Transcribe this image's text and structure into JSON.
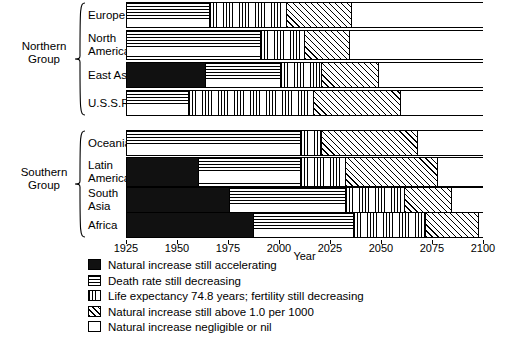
{
  "chart_data": {
    "type": "bar",
    "orientation": "horizontal-stacked-timeline",
    "title": "",
    "xlabel": "Year",
    "ylabel": "",
    "xlim": [
      1925,
      2100
    ],
    "xticks": [
      1925,
      1950,
      1975,
      2000,
      2025,
      2050,
      2075,
      2100
    ],
    "xticklabels": [
      "1925",
      "1950",
      "1975",
      "2000",
      "2025",
      "2050",
      "2075",
      "2100"
    ],
    "grid": false,
    "legend_position": "below",
    "stage_names": [
      "Natural increase still accelerating",
      "Death rate still decreasing",
      "Life expectancy 74.8 years; fertility still decreasing",
      "Natural increase still above 1.0 per 1000",
      "Natural increase negligible or nil"
    ],
    "stage_patterns": [
      "solid-black",
      "horizontal-lines",
      "vertical-lines",
      "diagonal-hatch",
      "white-empty"
    ],
    "groups": [
      {
        "name": "Northern Group",
        "regions": [
          {
            "name": "Europe",
            "label_lines": [
              "Europe"
            ],
            "boundaries": [
              1925,
              1965,
              2003,
              2035,
              2100
            ],
            "segments": [
              {
                "stage": 0,
                "start": 1925,
                "end": 1925
              },
              {
                "stage": 1,
                "start": 1925,
                "end": 1965
              },
              {
                "stage": 2,
                "start": 1965,
                "end": 2003
              },
              {
                "stage": 3,
                "start": 2003,
                "end": 2035
              },
              {
                "stage": 4,
                "start": 2035,
                "end": 2100
              }
            ]
          },
          {
            "name": "North America",
            "label_lines": [
              "North",
              "America"
            ],
            "boundaries": [
              1925,
              1990,
              2012,
              2034,
              2100
            ],
            "segments": [
              {
                "stage": 0,
                "start": 1925,
                "end": 1925
              },
              {
                "stage": 1,
                "start": 1925,
                "end": 1990
              },
              {
                "stage": 2,
                "start": 1990,
                "end": 2012
              },
              {
                "stage": 3,
                "start": 2012,
                "end": 2034
              },
              {
                "stage": 4,
                "start": 2034,
                "end": 2100
              }
            ]
          },
          {
            "name": "East Asia",
            "label_lines": [
              "East Asia"
            ],
            "boundaries": [
              1963,
              2000,
              2020,
              2048
            ],
            "segments": [
              {
                "stage": 0,
                "start": 1925,
                "end": 1963
              },
              {
                "stage": 1,
                "start": 1963,
                "end": 2000
              },
              {
                "stage": 2,
                "start": 2000,
                "end": 2020
              },
              {
                "stage": 3,
                "start": 2020,
                "end": 2048
              },
              {
                "stage": 4,
                "start": 2048,
                "end": 2100
              }
            ]
          },
          {
            "name": "U.S.S.R.",
            "label_lines": [
              "U.S.S.R."
            ],
            "boundaries": [
              1925,
              1955,
              2016,
              2059,
              2100
            ],
            "segments": [
              {
                "stage": 0,
                "start": 1925,
                "end": 1925
              },
              {
                "stage": 1,
                "start": 1925,
                "end": 1955
              },
              {
                "stage": 2,
                "start": 1955,
                "end": 2016
              },
              {
                "stage": 3,
                "start": 2016,
                "end": 2059
              },
              {
                "stage": 4,
                "start": 2059,
                "end": 2100
              }
            ]
          }
        ]
      },
      {
        "name": "Southern Group",
        "regions": [
          {
            "name": "Oceania",
            "label_lines": [
              "Oceania"
            ],
            "boundaries": [
              1925,
              2010,
              2020,
              2067,
              2100
            ],
            "segments": [
              {
                "stage": 0,
                "start": 1925,
                "end": 1925
              },
              {
                "stage": 1,
                "start": 1925,
                "end": 2010
              },
              {
                "stage": 2,
                "start": 2010,
                "end": 2020
              },
              {
                "stage": 3,
                "start": 2020,
                "end": 2067
              },
              {
                "stage": 4,
                "start": 2067,
                "end": 2100
              }
            ]
          },
          {
            "name": "Latin America",
            "label_lines": [
              "Latin",
              "America"
            ],
            "boundaries": [
              1960,
              2010,
              2032,
              2077
            ],
            "segments": [
              {
                "stage": 0,
                "start": 1925,
                "end": 1960
              },
              {
                "stage": 1,
                "start": 1960,
                "end": 2010
              },
              {
                "stage": 2,
                "start": 2010,
                "end": 2032
              },
              {
                "stage": 3,
                "start": 2032,
                "end": 2077
              },
              {
                "stage": 4,
                "start": 2077,
                "end": 2100
              }
            ]
          },
          {
            "name": "South Asia",
            "label_lines": [
              "South",
              "Asia"
            ],
            "boundaries": [
              1975,
              2032,
              2061,
              2084
            ],
            "segments": [
              {
                "stage": 0,
                "start": 1925,
                "end": 1975
              },
              {
                "stage": 1,
                "start": 1975,
                "end": 2032
              },
              {
                "stage": 2,
                "start": 2032,
                "end": 2061
              },
              {
                "stage": 3,
                "start": 2061,
                "end": 2084
              },
              {
                "stage": 4,
                "start": 2084,
                "end": 2100
              }
            ]
          },
          {
            "name": "Africa",
            "label_lines": [
              "Africa"
            ],
            "boundaries": [
              1987,
              2036,
              2071,
              2097
            ],
            "segments": [
              {
                "stage": 0,
                "start": 1925,
                "end": 1987
              },
              {
                "stage": 1,
                "start": 1987,
                "end": 2036
              },
              {
                "stage": 2,
                "start": 2036,
                "end": 2071
              },
              {
                "stage": 3,
                "start": 2071,
                "end": 2097
              },
              {
                "stage": 4,
                "start": 2097,
                "end": 2100
              }
            ]
          }
        ]
      }
    ]
  },
  "axis": {
    "xlabel": "Year"
  },
  "legend": {
    "items": [
      {
        "pattern": "solid-black",
        "label": "Natural increase still accelerating"
      },
      {
        "pattern": "horizontal-lines",
        "label": "Death rate still decreasing"
      },
      {
        "pattern": "vertical-lines",
        "label": "Life expectancy 74.8 years; fertility still decreasing"
      },
      {
        "pattern": "diagonal-hatch",
        "label": "Natural increase still above 1.0 per 1000"
      },
      {
        "pattern": "white-empty",
        "label": "Natural increase negligible or nil"
      }
    ]
  },
  "colors": {
    "ink": "#000000",
    "background": "#ffffff"
  }
}
